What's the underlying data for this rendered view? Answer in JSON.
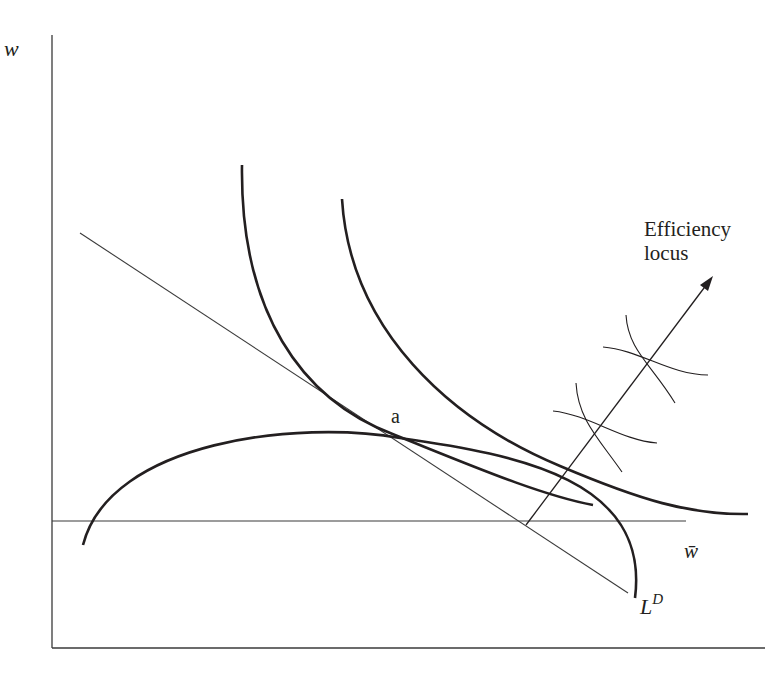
{
  "diagram": {
    "type": "economics-graph",
    "axes": {
      "y_label": "w",
      "x_label": ""
    },
    "labels": {
      "point_a": "a",
      "efficiency_locus_line1": "Efficiency",
      "efficiency_locus_line2": "locus",
      "w_bar": "w̄",
      "labor_demand_base": "L",
      "labor_demand_sup": "D"
    },
    "colors": {
      "ink": "#231f20",
      "thin_line": "#3a3a3a",
      "background": "#ffffff"
    },
    "elements": [
      "vertical axis w",
      "horizontal axis",
      "horizontal line at w̄",
      "downward sloping labor demand line L^D",
      "two convex indifference curves",
      "inverted-U iso-profit curve tangent at point a",
      "efficiency locus arrow with crossing curve pairs"
    ]
  }
}
